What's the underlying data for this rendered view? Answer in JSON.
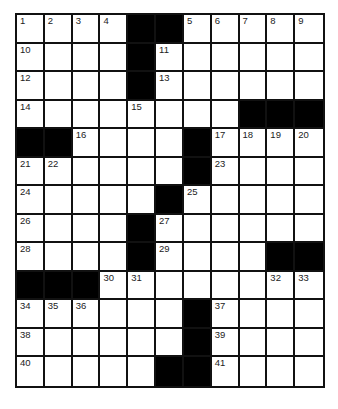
{
  "puzzle": {
    "rows": 13,
    "cols": 11,
    "layout": [
      "....##.....",
      "....#......",
      "....#......",
      "........###",
      "##....#....",
      "......#....",
      ".....#.....",
      "....#......",
      "....#....##",
      "###........",
      "......#....",
      "......#....",
      ".....##...."
    ],
    "numbers": [
      {
        "r": 0,
        "c": 0,
        "n": "1"
      },
      {
        "r": 0,
        "c": 1,
        "n": "2"
      },
      {
        "r": 0,
        "c": 2,
        "n": "3"
      },
      {
        "r": 0,
        "c": 3,
        "n": "4"
      },
      {
        "r": 0,
        "c": 6,
        "n": "5"
      },
      {
        "r": 0,
        "c": 7,
        "n": "6"
      },
      {
        "r": 0,
        "c": 8,
        "n": "7"
      },
      {
        "r": 0,
        "c": 9,
        "n": "8"
      },
      {
        "r": 0,
        "c": 10,
        "n": "9"
      },
      {
        "r": 1,
        "c": 0,
        "n": "10"
      },
      {
        "r": 1,
        "c": 5,
        "n": "11"
      },
      {
        "r": 2,
        "c": 0,
        "n": "12"
      },
      {
        "r": 2,
        "c": 5,
        "n": "13"
      },
      {
        "r": 3,
        "c": 0,
        "n": "14"
      },
      {
        "r": 3,
        "c": 4,
        "n": "15"
      },
      {
        "r": 4,
        "c": 2,
        "n": "16"
      },
      {
        "r": 4,
        "c": 7,
        "n": "17"
      },
      {
        "r": 4,
        "c": 8,
        "n": "18"
      },
      {
        "r": 4,
        "c": 9,
        "n": "19"
      },
      {
        "r": 4,
        "c": 10,
        "n": "20"
      },
      {
        "r": 5,
        "c": 0,
        "n": "21"
      },
      {
        "r": 5,
        "c": 1,
        "n": "22"
      },
      {
        "r": 5,
        "c": 7,
        "n": "23"
      },
      {
        "r": 6,
        "c": 0,
        "n": "24"
      },
      {
        "r": 6,
        "c": 6,
        "n": "25"
      },
      {
        "r": 7,
        "c": 0,
        "n": "26"
      },
      {
        "r": 7,
        "c": 5,
        "n": "27"
      },
      {
        "r": 8,
        "c": 0,
        "n": "28"
      },
      {
        "r": 8,
        "c": 5,
        "n": "29"
      },
      {
        "r": 9,
        "c": 3,
        "n": "30"
      },
      {
        "r": 9,
        "c": 4,
        "n": "31"
      },
      {
        "r": 9,
        "c": 9,
        "n": "32"
      },
      {
        "r": 9,
        "c": 10,
        "n": "33"
      },
      {
        "r": 10,
        "c": 0,
        "n": "34"
      },
      {
        "r": 10,
        "c": 1,
        "n": "35"
      },
      {
        "r": 10,
        "c": 2,
        "n": "36"
      },
      {
        "r": 10,
        "c": 7,
        "n": "37"
      },
      {
        "r": 11,
        "c": 0,
        "n": "38"
      },
      {
        "r": 11,
        "c": 7,
        "n": "39"
      },
      {
        "r": 12,
        "c": 0,
        "n": "40"
      },
      {
        "r": 12,
        "c": 7,
        "n": "41"
      }
    ]
  }
}
